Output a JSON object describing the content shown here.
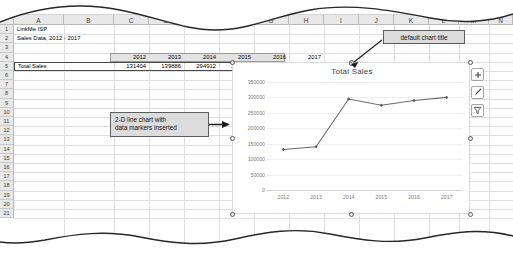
{
  "app": {
    "type": "spreadsheet",
    "columns": [
      "A",
      "B",
      "C",
      "D",
      "E",
      "F",
      "G",
      "H",
      "I",
      "J",
      "K",
      "L",
      "M",
      "N"
    ],
    "visible_column_letters": [
      "A",
      "B",
      "F",
      "G",
      "H",
      "L",
      "M",
      "N"
    ],
    "rows": [
      "1",
      "2",
      "3",
      "4",
      "5",
      "6",
      "7",
      "8",
      "9",
      "10",
      "11",
      "12",
      "13",
      "14",
      "15",
      "16",
      "17",
      "18",
      "19",
      "20",
      "21"
    ]
  },
  "sheet": {
    "title_line1": "LinkMe ISP",
    "title_line2": "Sales Data, 2012 - 2017",
    "row_label": "Total Sales",
    "year_headers": [
      "2012",
      "2013",
      "2014",
      "2015",
      "2016",
      "2017"
    ],
    "values": [
      "131404",
      "139886",
      "294912",
      "274895",
      "290155",
      "300030"
    ]
  },
  "chart": {
    "title": "Total Sales",
    "buttons": [
      {
        "name": "chart-elements",
        "glyph": "+"
      },
      {
        "name": "chart-styles",
        "glyph": "brush"
      },
      {
        "name": "chart-filters",
        "glyph": "filter"
      }
    ]
  },
  "chart_data": {
    "type": "line",
    "title": "Total Sales",
    "categories": [
      "2012",
      "2013",
      "2014",
      "2015",
      "2016",
      "2017"
    ],
    "values": [
      131404,
      139886,
      294912,
      274895,
      290155,
      300030
    ],
    "series": [
      {
        "name": "Total Sales",
        "values": [
          131404,
          139886,
          294912,
          274895,
          290155,
          300030
        ]
      }
    ],
    "xlabel": "",
    "ylabel": "",
    "ylim": [
      0,
      350000
    ],
    "yticks": [
      0,
      50000,
      100000,
      150000,
      200000,
      250000,
      300000,
      350000
    ],
    "ytick_labels": [
      "0",
      "50000",
      "100000",
      "150000",
      "200000",
      "250000",
      "300000",
      "350000"
    ],
    "grid": true,
    "legend": false,
    "markers": true,
    "line_color": "#6b6b6b",
    "marker_color": "#5a5a5a"
  },
  "annotations": {
    "chart_title_callout": "default chart title",
    "chart_type_callout": "2-D line chart with\ndata markers inserted"
  },
  "colors": {
    "grid": "#dfdfdf",
    "header_bg": "#e8e8e8",
    "callout_bg": "#dcdcdc",
    "callout_border": "#5d5d5d",
    "selection": "#4a4a4a"
  }
}
